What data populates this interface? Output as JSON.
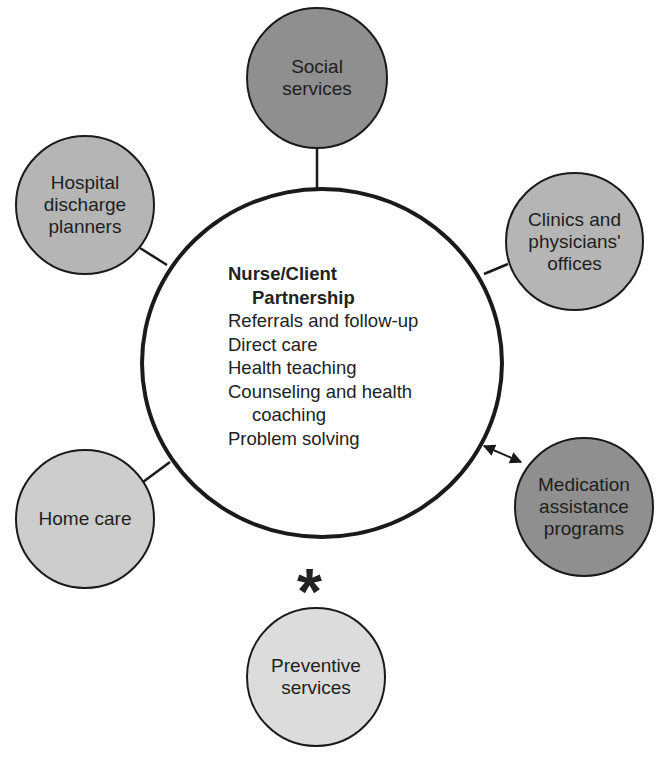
{
  "diagram": {
    "center": {
      "title_line1": "Nurse/Client",
      "title_line2": "Partnership",
      "items": [
        "Referrals and follow-up",
        "Direct care",
        "Health teaching",
        "Counseling and health",
        "coaching",
        "Problem solving"
      ]
    },
    "nodes": [
      {
        "label": "Social\nservices",
        "fill": "#8f8f8f",
        "connector": "line"
      },
      {
        "label": "Hospital\ndischarge\nplanners",
        "fill": "#b5b5b5",
        "connector": "line"
      },
      {
        "label": "Clinics and\nphysicians'\noffices",
        "fill": "#b5b5b5",
        "connector": "line"
      },
      {
        "label": "Medication\nassistance\nprograms",
        "fill": "#8f8f8f",
        "connector": "double-arrow"
      },
      {
        "label": "Home care",
        "fill": "#cdcdcd",
        "connector": "line"
      },
      {
        "label": "Preventive\nservices",
        "fill": "#dcdcdc",
        "connector": "none"
      }
    ],
    "asterisk": "*"
  }
}
